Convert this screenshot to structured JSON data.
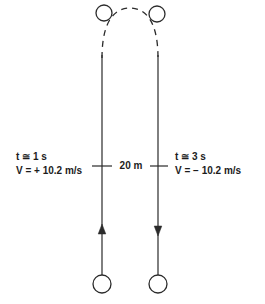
{
  "figure": {
    "stroke_color": "#2b2b2b",
    "background_color": "#ffffff",
    "ball_fill": "#ffffff"
  },
  "labels": {
    "left": {
      "time": "t ≅ 1 s",
      "velocity": "V = + 10.2 m/s"
    },
    "right": {
      "time": "t ≅ 3 s",
      "velocity": "V = − 10.2 m/s"
    },
    "distance": "20 m"
  },
  "elements": {
    "up_path_name": "upward-trajectory-line",
    "down_path_name": "downward-trajectory-line",
    "arc_name": "dashed-apex-arc",
    "ball_top_left": "ball-apex-left",
    "ball_top_right": "ball-apex-right",
    "ball_bottom_left": "ball-start-left",
    "ball_bottom_right": "ball-end-right",
    "arrow_up": "arrowhead-up",
    "arrow_down": "arrowhead-down",
    "tick_left": "tick-mark-left",
    "tick_right": "tick-mark-right"
  }
}
